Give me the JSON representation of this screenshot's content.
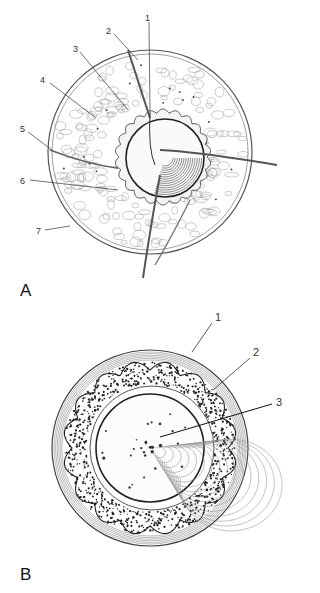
{
  "figure": {
    "panels": [
      {
        "id": "A",
        "panel_label": "A",
        "callouts": [
          "1",
          "2",
          "3",
          "4",
          "5",
          "6",
          "7"
        ]
      },
      {
        "id": "B",
        "panel_label": "B",
        "callouts": [
          "1",
          "2",
          "3"
        ]
      }
    ],
    "colors": {
      "ink": "#222222",
      "light_ink": "#777777",
      "background": "#ffffff"
    }
  }
}
